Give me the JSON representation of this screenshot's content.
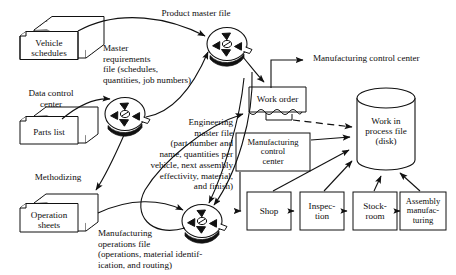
{
  "diagram": {
    "title_note": "Product master file",
    "free_labels": {
      "product_master_file": "Product master file",
      "master_requirements": "Master\nrequirements\nfile (schedules,\nquantities, job numbers)",
      "data_control_center": "Data control\ncenter",
      "engineering_master": "Engineering\nmaster file\n(part number and\nname, quantities per\nvehicle, next assembly\neffectivity, material,\nand finish)",
      "methodizing": "Methodizing",
      "manufacturing_operations": "Manufacturing\noperations file\n(operations, material identif-\nication, and routing)",
      "manufacturing_control_center_out": "Manufacturing control center"
    },
    "card_stacks": [
      {
        "id": "vehicle-schedules",
        "label": "Vehicle\nschedules",
        "line1": "Vehicle",
        "line2": "schedules"
      },
      {
        "id": "parts-list",
        "label": "Parts list",
        "line1": "Parts list",
        "line2": ""
      },
      {
        "id": "operation-sheets",
        "label": "Operation\nsheets",
        "line1": "Operation",
        "line2": "sheets"
      }
    ],
    "tape_reels": [
      {
        "id": "product-master-file-tape",
        "caption": "Product master file"
      },
      {
        "id": "engineering-master-file-tape",
        "caption": "Engineering master file"
      },
      {
        "id": "manufacturing-operations-file-tape",
        "caption": "Manufacturing operations file"
      }
    ],
    "documents": [
      {
        "id": "work-order",
        "label": "Work order"
      }
    ],
    "boxes": [
      {
        "id": "manufacturing-control-center",
        "line1": "Manufacturing",
        "line2": "control",
        "line3": "center"
      },
      {
        "id": "shop",
        "line1": "Shop",
        "line2": "",
        "line3": ""
      },
      {
        "id": "inspection",
        "line1": "Inspec-",
        "line2": "tion",
        "line3": ""
      },
      {
        "id": "stockroom",
        "line1": "Stock-",
        "line2": "room",
        "line3": ""
      },
      {
        "id": "assembly-manufacturing",
        "line1": "Assembly",
        "line2": "manufac-",
        "line3": "turing"
      }
    ],
    "cylinders": [
      {
        "id": "work-in-process-file",
        "line1": "Work in",
        "line2": "process file",
        "line3": "(disk)"
      }
    ],
    "colors": {
      "ink": "#0d0d0d",
      "stroke": "#1a1a1a",
      "paper": "#ffffff"
    }
  }
}
